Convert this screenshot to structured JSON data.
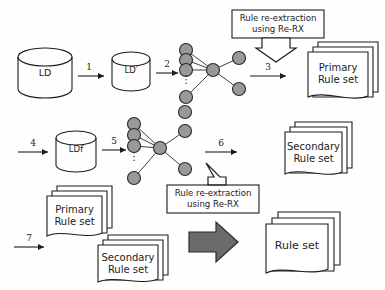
{
  "diagram": {
    "type": "flow-diagram",
    "colors": {
      "background": "#fefefe",
      "stroke": "#1c1c1c",
      "node_fill": "#999999",
      "block_arrow_fill": "#6b6b6b",
      "paper_fill": "#ffffff"
    }
  },
  "databases": {
    "ld": "LD",
    "ld_prime": "LD′",
    "ldf": "LDf"
  },
  "boxes": {
    "rerx_top": {
      "line1": "Rule re-extraction",
      "line2": "using Re-RX"
    },
    "rerx_middle": {
      "line1": "Rule re-extraction",
      "line2": "using Re-RX"
    }
  },
  "documents": {
    "primary_top": {
      "line1": "Primary",
      "line2": "Rule set"
    },
    "secondary_middle": {
      "line1": "Secondary",
      "line2": "Rule set"
    },
    "primary_bottom": {
      "line1": "Primary",
      "line2": "Rule set"
    },
    "secondary_bottom": {
      "line1": "Secondary",
      "line2": "Rule set"
    },
    "final": {
      "line1": "Rule set"
    }
  },
  "step_numbers": {
    "s1": "1",
    "s2": "2",
    "s3": "3",
    "s4": "4",
    "s5": "5",
    "s6": "6",
    "s7": "7"
  },
  "networks": {
    "net1": {
      "ellipsis": "⋮",
      "input_nodes": 4,
      "hidden_nodes": 1,
      "output_nodes": 2
    },
    "net2": {
      "ellipsis": "⋮",
      "input_nodes": 4,
      "hidden_nodes": 1,
      "output_nodes": 2
    }
  }
}
